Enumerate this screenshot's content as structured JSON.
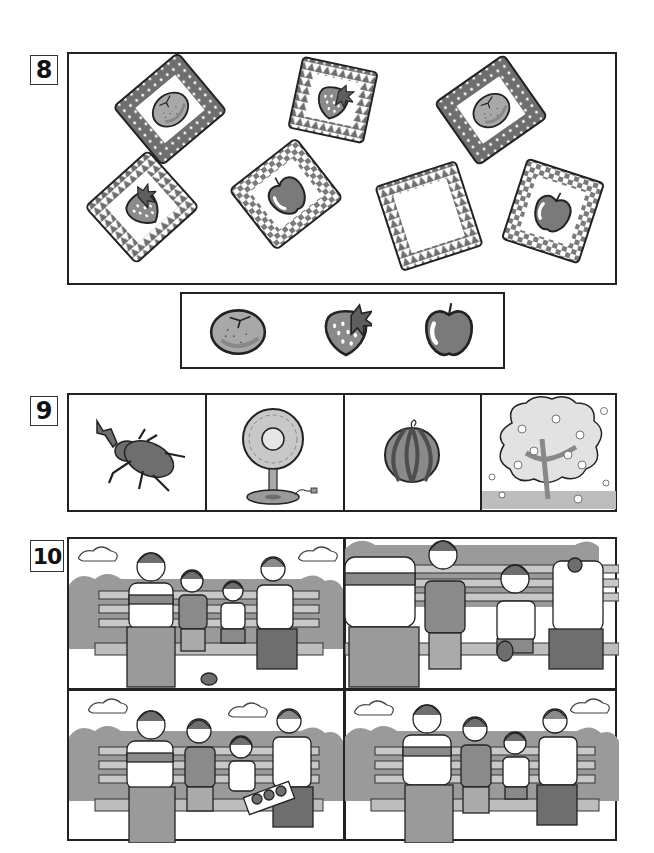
{
  "worksheet": {
    "questions": [
      {
        "number": "8",
        "cards": [
          {
            "fruit": "tangerine",
            "pattern": "polka-dot",
            "icon": "tangerine-icon"
          },
          {
            "fruit": "strawberry",
            "pattern": "triangle",
            "icon": "strawberry-icon"
          },
          {
            "fruit": "tangerine",
            "pattern": "polka-dot",
            "icon": "tangerine-icon"
          },
          {
            "fruit": "strawberry",
            "pattern": "triangle",
            "icon": "strawberry-icon"
          },
          {
            "fruit": "apple",
            "pattern": "checker",
            "icon": "apple-icon"
          },
          {
            "fruit": "empty",
            "pattern": "triangle",
            "icon": ""
          },
          {
            "fruit": "apple",
            "pattern": "checker",
            "icon": "apple-icon"
          }
        ],
        "options": [
          "tangerine",
          "strawberry",
          "apple"
        ]
      },
      {
        "number": "9",
        "items": [
          "rhinoceros-beetle",
          "electric-fan",
          "watermelon",
          "cherry-blossom-tree"
        ]
      },
      {
        "number": "10",
        "panels": [
          {
            "position": "top-left",
            "scene": "family on bench, youngest child crying, donut dropped on ground"
          },
          {
            "position": "top-right",
            "scene": "family eating donuts, youngest child drops donut"
          },
          {
            "position": "bottom-left",
            "scene": "mother opens box of donuts, youngest child cheers"
          },
          {
            "position": "bottom-right",
            "scene": "whole family happily eating donuts on bench"
          }
        ]
      }
    ]
  },
  "colors": {
    "ink": "#222222",
    "dark_gray": "#6e6e6e",
    "mid_gray": "#9a9a9a",
    "light_gray": "#c8c8c8",
    "paper": "#ffffff"
  }
}
